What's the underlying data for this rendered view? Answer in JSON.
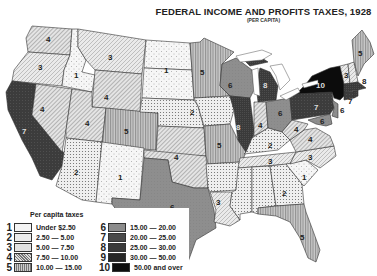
{
  "title": "FEDERAL INCOME AND PROFITS TAXES, 1928",
  "subtitle": "(PER CAPITA)",
  "legend": {
    "title": "Per capita taxes",
    "items": [
      {
        "num": "1",
        "label": "Under  $2.50"
      },
      {
        "num": "2",
        "label": "2.50 — 5.00"
      },
      {
        "num": "3",
        "label": "5.00 — 7.50"
      },
      {
        "num": "4",
        "label": "7.50 — 10.00"
      },
      {
        "num": "5",
        "label": "10.00 — 15.00"
      },
      {
        "num": "6",
        "label": "15.00 — 20.00"
      },
      {
        "num": "7",
        "label": "20.00 — 25.00"
      },
      {
        "num": "8",
        "label": "25.00 — 30.00"
      },
      {
        "num": "9",
        "label": "30.00 — 50.00"
      },
      {
        "num": "10",
        "label": "50.00 and over"
      }
    ]
  },
  "states": [
    {
      "name": "Washington",
      "class": 4
    },
    {
      "name": "Oregon",
      "class": 3
    },
    {
      "name": "California",
      "class": 7
    },
    {
      "name": "Idaho",
      "class": 1
    },
    {
      "name": "Nevada",
      "class": 4
    },
    {
      "name": "Montana",
      "class": 3
    },
    {
      "name": "Wyoming",
      "class": 4
    },
    {
      "name": "Utah",
      "class": 4
    },
    {
      "name": "Colorado",
      "class": 5
    },
    {
      "name": "Arizona",
      "class": 2
    },
    {
      "name": "New Mexico",
      "class": 1
    },
    {
      "name": "North Dakota",
      "class": 1
    },
    {
      "name": "South Dakota",
      "class": 1
    },
    {
      "name": "Nebraska",
      "class": 2
    },
    {
      "name": "Kansas",
      "class": 4
    },
    {
      "name": "Oklahoma",
      "class": 4
    },
    {
      "name": "Texas",
      "class": 6
    },
    {
      "name": "Minnesota",
      "class": 5
    },
    {
      "name": "Iowa",
      "class": 2
    },
    {
      "name": "Missouri",
      "class": 5
    },
    {
      "name": "Arkansas",
      "class": 2
    },
    {
      "name": "Louisiana",
      "class": 3
    },
    {
      "name": "Wisconsin",
      "class": 6
    },
    {
      "name": "Illinois",
      "class": 8
    },
    {
      "name": "Michigan",
      "class": 8
    },
    {
      "name": "Indiana",
      "class": 4
    },
    {
      "name": "Ohio",
      "class": 6
    },
    {
      "name": "Kentucky",
      "class": 2
    },
    {
      "name": "Tennessee",
      "class": 3
    },
    {
      "name": "Mississippi",
      "class": 2
    },
    {
      "name": "Alabama",
      "class": 2
    },
    {
      "name": "Georgia",
      "class": 2
    },
    {
      "name": "Florida",
      "class": 5
    },
    {
      "name": "South Carolina",
      "class": 1
    },
    {
      "name": "North Carolina",
      "class": 3
    },
    {
      "name": "Virginia",
      "class": 4
    },
    {
      "name": "West Virginia",
      "class": 4
    },
    {
      "name": "Pennsylvania",
      "class": 7
    },
    {
      "name": "New York",
      "class": 10
    },
    {
      "name": "New Jersey",
      "class": 6
    },
    {
      "name": "Delaware",
      "class": 6
    },
    {
      "name": "Maryland",
      "class": 6
    },
    {
      "name": "Maine",
      "class": 5
    },
    {
      "name": "Vermont",
      "class": 3
    },
    {
      "name": "New Hampshire",
      "class": 3
    },
    {
      "name": "Massachusetts",
      "class": 8
    },
    {
      "name": "Connecticut",
      "class": 7
    },
    {
      "name": "Rhode Island",
      "class": 8
    }
  ],
  "labels": {
    "wa": "4",
    "or": "3",
    "ca": "7",
    "id": "1",
    "nv": "4",
    "mt": "3",
    "wy": "4",
    "ut": "4",
    "co": "5",
    "az": "2",
    "nm": "1",
    "nd": "1",
    "sd": "",
    "ne": "2",
    "ks": "4",
    "ok": "4",
    "tx": "6",
    "mn": "5",
    "ia": "2",
    "mo": "5",
    "ar": "",
    "la": "3",
    "wi": "6",
    "il": "8",
    "mi": "8",
    "in": "4",
    "oh": "6",
    "ky": "2",
    "tn": "3",
    "ms": "",
    "al": "",
    "ga": "2",
    "fl": "5",
    "sc": "1",
    "nc": "3",
    "va": "4",
    "wv": "4",
    "pa": "7",
    "ny": "10",
    "nj": "6",
    "md": "6",
    "me": "5",
    "vt": "3",
    "ma": "8",
    "ct": "7",
    "ri": "8"
  },
  "colors": {
    "ink": "#222222",
    "paper": "#ffffff",
    "c1": "#f4f4f4",
    "c2": "#ececec",
    "c3": "#e6e6e6",
    "c4": "#d8d8d8",
    "c5": "#b8b8b8",
    "c6": "#8c8c8c",
    "c7": "#4a4a4a",
    "c8": "#3a3a3a",
    "c9": "#262626",
    "c10": "#0e0e0e"
  }
}
